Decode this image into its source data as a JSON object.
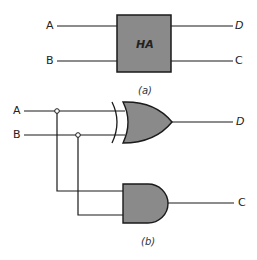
{
  "panel_a": {
    "block_label": "HA",
    "inputs": [
      "A",
      "B"
    ],
    "outputs": [
      "D",
      "C"
    ],
    "caption": "(a)"
  },
  "panel_b": {
    "inputs": [
      "A",
      "B"
    ],
    "xor_output": "D",
    "and_output": "C",
    "caption": "(b)"
  },
  "colors": {
    "gate_fill": "#8a8a8a",
    "line": "#1a1a1a"
  }
}
